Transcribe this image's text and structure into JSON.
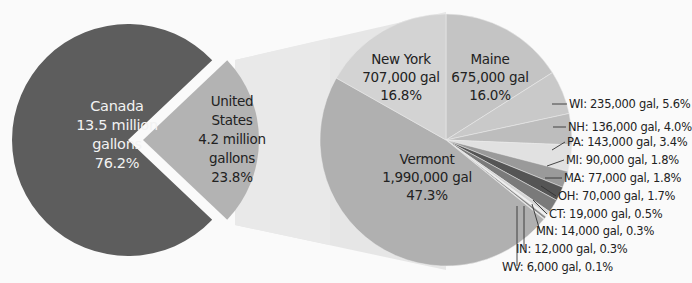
{
  "chart_data": {
    "type": "pie",
    "title": "",
    "pies": [
      {
        "name": "Maple syrup production by country",
        "slices": [
          {
            "label": "Canada",
            "amount": "13.5 million gallons",
            "percent": 76.2,
            "color": "#5d5d5d"
          },
          {
            "label": "United States",
            "amount": "4.2 million gallons",
            "percent": 23.8,
            "color": "#b3b3b3",
            "exploded": true
          }
        ]
      },
      {
        "name": "United States breakdown by state",
        "slices": [
          {
            "label": "Maine",
            "amount": "675,000 gal",
            "gallons": 675000,
            "percent": 16.0,
            "color": "#c4c4c4"
          },
          {
            "label": "WI",
            "amount": "235,000 gal",
            "gallons": 235000,
            "percent": 5.6,
            "color": "#c9c9c9"
          },
          {
            "label": "NH",
            "amount": "136,000 gal",
            "gallons": 136000,
            "percent": 4.0,
            "color": "#bdbdbd"
          },
          {
            "label": "PA",
            "amount": "143,000 gal",
            "gallons": 143000,
            "percent": 3.4,
            "color": "#e1e1e1"
          },
          {
            "label": "MI",
            "amount": "90,000 gal",
            "gallons": 90000,
            "percent": 2.1,
            "color": "#9a9a9a"
          },
          {
            "label": "MA",
            "amount": "77,000 gal",
            "gallons": 77000,
            "percent": 1.8,
            "color": "#555555"
          },
          {
            "label": "OH",
            "amount": "70,000 gal",
            "gallons": 70000,
            "percent": 1.7,
            "color": "#7a7a7a"
          },
          {
            "label": "CT",
            "amount": "19,000 gal",
            "gallons": 19000,
            "percent": 0.5,
            "color": "#d6d6d6"
          },
          {
            "label": "MN",
            "amount": "14,000 gal",
            "gallons": 14000,
            "percent": 0.3,
            "color": "#f0f0f0"
          },
          {
            "label": "IN",
            "amount": "12,000 gal",
            "gallons": 12000,
            "percent": 0.3,
            "color": "#8a8a8a"
          },
          {
            "label": "WV",
            "amount": "6,000 gal",
            "gallons": 6000,
            "percent": 0.1,
            "color": "#dddddd"
          },
          {
            "label": "Vermont",
            "amount": "1,990,000 gal",
            "gallons": 1990000,
            "percent": 47.3,
            "color": "#b0b0b0"
          },
          {
            "label": "New York",
            "amount": "707,000 gal",
            "gallons": 707000,
            "percent": 16.8,
            "color": "#d3d3d3"
          }
        ]
      }
    ],
    "legend": "none",
    "grid": false
  },
  "labels": {
    "canada": {
      "name": "Canada",
      "amount": "13.5 million",
      "unit": "gallons",
      "pct": "76.2%"
    },
    "us": {
      "name1": "United",
      "name2": "States",
      "amount": "4.2 million",
      "unit": "gallons",
      "pct": "23.8%"
    },
    "newyork": {
      "name": "New York",
      "amount": "707,000 gal",
      "pct": "16.8%"
    },
    "maine": {
      "name": "Maine",
      "amount": "675,000 gal",
      "pct": "16.0%"
    },
    "vermont": {
      "name": "Vermont",
      "amount": "1,990,000 gal",
      "pct": "47.3%"
    },
    "wi": "WI: 235,000 gal, 5.6%",
    "nh": "NH: 136,000 gal, 4.0%",
    "pa": "PA: 143,000 gal, 3.4%",
    "mi": "MI: 90,000 gal, 1.8%",
    "ma": "MA: 77,000 gal, 1.8%",
    "oh": "OH: 70,000 gal, 1.7%",
    "ct": "CT: 19,000 gal, 0.5%",
    "mn": "MN: 14,000 gal, 0.3%",
    "in": "IN: 12,000 gal, 0.3%",
    "wv": "WV: 6,000 gal, 0.1%"
  }
}
